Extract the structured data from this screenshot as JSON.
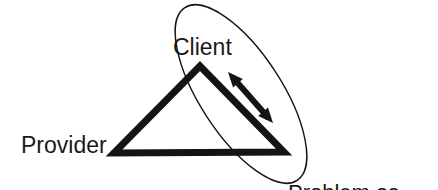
{
  "diagram": {
    "type": "service-triangle",
    "background_color": "#ffffff",
    "stroke_color": "#141414",
    "labels": {
      "provider": "Provider",
      "client": "Client",
      "problem_line1": "Problem as",
      "problem_line2": "client sees it"
    },
    "shapes": {
      "triangle": {
        "name": "triangle",
        "stroke_width": 7,
        "fill": "none",
        "vertices": [
          {
            "name": "apex-client",
            "x": 200,
            "y": 66
          },
          {
            "name": "left-provider",
            "x": 114,
            "y": 153
          },
          {
            "name": "right-problem",
            "x": 284,
            "y": 152
          }
        ],
        "points": "200,66 114,153 284,152"
      },
      "ellipse": {
        "name": "ellipse",
        "stroke_width": 1.4,
        "fill": "none",
        "center_x": 241,
        "center_y": 94,
        "radius_x": 103,
        "radius_y": 41,
        "rotation_deg": 57
      },
      "arrow": {
        "name": "double-headed-arrow",
        "stroke_width": 6,
        "start_x": 228,
        "start_y": 72,
        "end_x": 273,
        "end_y": 123,
        "head_length": 15,
        "head_width": 13,
        "double_headed": true
      }
    }
  }
}
